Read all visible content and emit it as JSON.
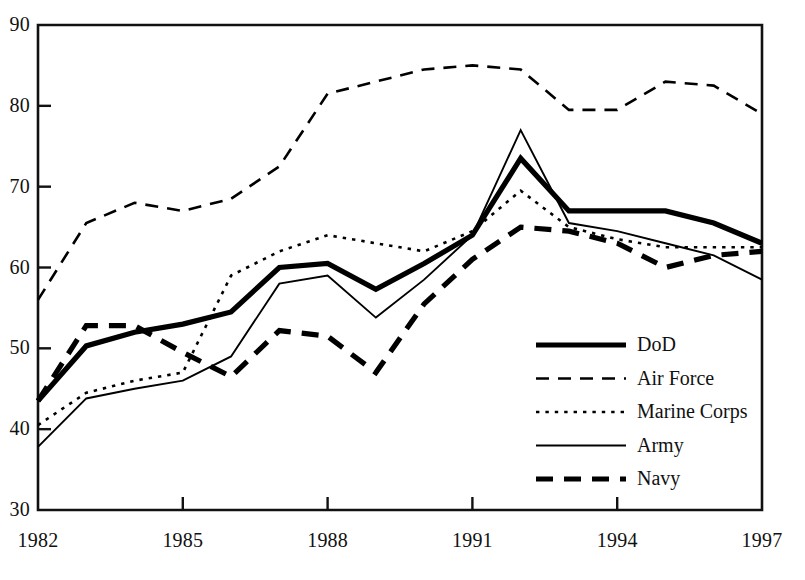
{
  "chart_data": {
    "type": "line",
    "title": "",
    "subtitle": "",
    "xlabel": "",
    "ylabel": "",
    "x": [
      1982,
      1983,
      1984,
      1985,
      1986,
      1987,
      1988,
      1989,
      1990,
      1991,
      1992,
      1993,
      1994,
      1995,
      1996,
      1997
    ],
    "xlim": [
      1982,
      1997
    ],
    "ylim": [
      30,
      90
    ],
    "xticks": [
      1982,
      1985,
      1988,
      1991,
      1994,
      1997
    ],
    "xtick_labels": [
      "1982",
      "1985",
      "1988",
      "1991",
      "1994",
      "1997"
    ],
    "yticks": [
      30,
      40,
      50,
      60,
      70,
      80,
      90
    ],
    "ytick_labels": [
      "30",
      "40",
      "50",
      "60",
      "70",
      "80",
      "90"
    ],
    "grid": false,
    "legend_position": "lower right inside",
    "series": [
      {
        "name": "DoD",
        "style": "thick-solid",
        "color": "#000000",
        "values": [
          43.5,
          50.3,
          52.0,
          53.0,
          54.5,
          60.0,
          60.5,
          57.3,
          60.5,
          64.0,
          73.5,
          67.0,
          67.0,
          67.0,
          65.5,
          63.0
        ]
      },
      {
        "name": "Air Force",
        "style": "dashed",
        "color": "#000000",
        "values": [
          56.0,
          65.5,
          68.0,
          67.0,
          68.5,
          72.5,
          81.5,
          83.0,
          84.5,
          85.0,
          84.5,
          79.5,
          79.5,
          83.0,
          82.5,
          79.0
        ]
      },
      {
        "name": "Marine Corps",
        "style": "dotted",
        "color": "#000000",
        "values": [
          40.5,
          44.5,
          46.0,
          47.0,
          59.0,
          62.0,
          64.0,
          63.0,
          62.0,
          64.5,
          69.5,
          65.0,
          63.5,
          62.5,
          62.5,
          62.5
        ]
      },
      {
        "name": "Army",
        "style": "thin-solid",
        "color": "#000000",
        "values": [
          37.8,
          43.8,
          45.0,
          46.0,
          49.0,
          58.0,
          59.0,
          53.8,
          58.5,
          64.0,
          77.0,
          65.5,
          64.5,
          63.0,
          61.5,
          58.5
        ]
      },
      {
        "name": "Navy",
        "style": "thick-dashed",
        "color": "#000000",
        "values": [
          43.5,
          52.8,
          52.8,
          49.5,
          46.5,
          52.2,
          51.5,
          47.0,
          55.5,
          61.0,
          65.0,
          64.5,
          63.0,
          60.0,
          61.5,
          62.0
        ]
      }
    ]
  },
  "legend": {
    "items": [
      {
        "label": "DoD",
        "style": "thick-solid"
      },
      {
        "label": "Air Force",
        "style": "dashed"
      },
      {
        "label": "Marine Corps",
        "style": "dotted"
      },
      {
        "label": "Army",
        "style": "thin-solid"
      },
      {
        "label": "Navy",
        "style": "thick-dashed"
      }
    ]
  }
}
